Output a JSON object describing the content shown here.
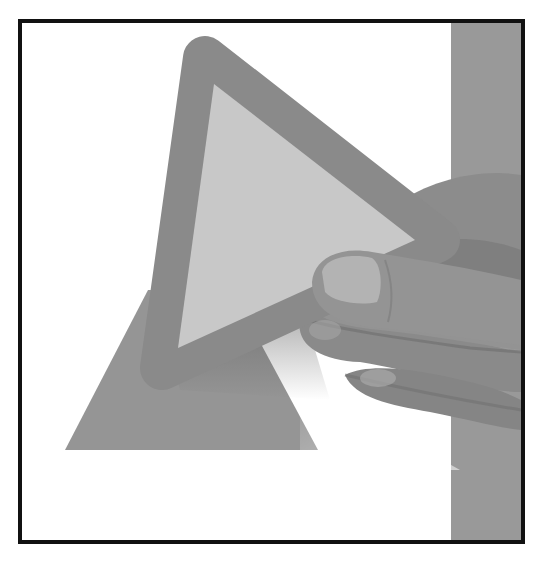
{
  "illustration": {
    "description": "Hand holding a rounded gray triangle in front of a flat gray triangle and vertical gray bar, inside a black frame",
    "colors": {
      "background": "#ffffff",
      "frame": "#111111",
      "bar": "#999999",
      "back_triangle": "#959595",
      "front_triangle_border": "#8a8a8a",
      "front_triangle_fill": "#c8c8c8",
      "hand": "#8f8f8f",
      "hand_shadow": "#6e6e6e",
      "hand_highlight": "#b2b2b2"
    },
    "frame": {
      "x": 20,
      "y": 21,
      "width": 503,
      "height": 521,
      "stroke": 4
    },
    "bar": {
      "x": 451,
      "y": 23,
      "width": 70,
      "height": 517
    },
    "back_triangle": {
      "points": "65,450 318,450 224,290 152,290"
    },
    "front_triangle": {
      "outer_points": "205,58 438,240 162,368",
      "inner_points": "214,84 415,240 178,348",
      "corner_radius": 22
    }
  }
}
